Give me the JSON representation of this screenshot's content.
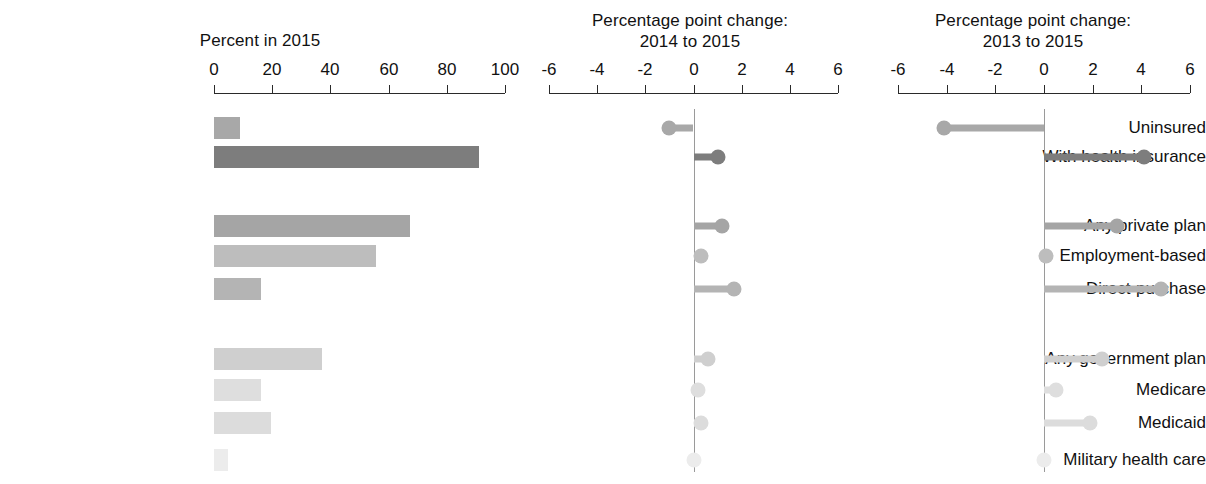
{
  "chart_data": {
    "type": "bar",
    "categories": [
      "Uninsured",
      "With health insurance",
      "Any private plan",
      "Employment-based",
      "Direct-purchase",
      "Any government plan",
      "Medicare",
      "Medicaid",
      "Military health care"
    ],
    "panels": [
      {
        "id": "percent-2015",
        "type": "bar",
        "title_lines": [
          "Percent in 2015"
        ],
        "xlabel": "",
        "ylabel": "",
        "xlim": [
          0,
          100
        ],
        "ticks": [
          0,
          20,
          40,
          60,
          80,
          100
        ],
        "tick_labels": [
          "0",
          "20",
          "40",
          "60",
          "80",
          "100"
        ],
        "grid": false,
        "values": [
          9.1,
          90.9,
          67.2,
          55.7,
          16.3,
          37.1,
          16.3,
          19.6,
          4.7
        ]
      },
      {
        "id": "change-2014-2015",
        "type": "lollipop",
        "title_lines": [
          "Percentage point change:",
          "2014 to 2015"
        ],
        "xlabel": "",
        "ylabel": "",
        "xlim": [
          -6,
          6
        ],
        "ticks": [
          -6,
          -4,
          -2,
          0,
          2,
          4,
          6
        ],
        "tick_labels": [
          "-6",
          "-4",
          "-2",
          "0",
          "2",
          "4",
          "6"
        ],
        "grid": false,
        "values": [
          -1.0,
          1.0,
          1.2,
          0.3,
          1.7,
          0.6,
          0.2,
          0.3,
          0.0
        ]
      },
      {
        "id": "change-2013-2015",
        "type": "lollipop",
        "title_lines": [
          "Percentage point change:",
          "2013 to 2015"
        ],
        "xlabel": "",
        "ylabel": "",
        "xlim": [
          -6,
          6
        ],
        "ticks": [
          -6,
          -4,
          -2,
          0,
          2,
          4,
          6
        ],
        "tick_labels": [
          "-6",
          "-4",
          "-2",
          "0",
          "2",
          "4",
          "6"
        ],
        "grid": false,
        "values": [
          -4.1,
          4.1,
          3.0,
          0.1,
          4.8,
          2.4,
          0.5,
          1.9,
          0.0
        ]
      }
    ],
    "series_colors": [
      "#a8a8a8",
      "#7d7d7d",
      "#a5a5a5",
      "#bdbdbd",
      "#b4b4b4",
      "#cfcfcf",
      "#dedede",
      "#dcdcdc",
      "#ececec"
    ],
    "group_breaks": [
      2,
      5
    ],
    "legend_position": "none",
    "axis_color": "#2a2a2a",
    "zero_line_color": "#9a9a9a",
    "text_color": "#111111"
  },
  "layout": {
    "panel_geometry": [
      {
        "left": 0,
        "width": 520,
        "axis_x0": 214,
        "axis_x1": 505,
        "title_top": 30,
        "title_lines_top": [
          30
        ]
      },
      {
        "left": 520,
        "width": 340,
        "axis_x0": 29,
        "axis_x1": 318,
        "title_top": 10,
        "title_lines_top": [
          10,
          31
        ]
      },
      {
        "left": 860,
        "width": 346,
        "axis_x0": 38,
        "axis_x1": 330,
        "title_top": 10,
        "title_lines_top": [
          10,
          31
        ]
      }
    ],
    "axis_y": 93,
    "tick_label_y": 59,
    "row_y": [
      128,
      157,
      226,
      256,
      289,
      359,
      390,
      423,
      460
    ],
    "label_right": 204
  }
}
